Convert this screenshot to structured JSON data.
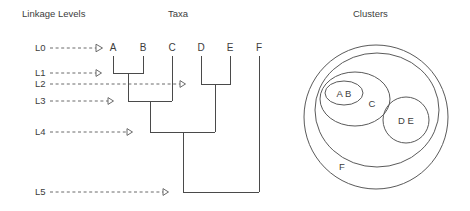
{
  "headings": {
    "linkage": "Linkage Levels",
    "taxa": "Taxa",
    "clusters": "Clusters"
  },
  "levels": [
    {
      "id": "L0",
      "label": "L0",
      "y": 48
    },
    {
      "id": "L1",
      "label": "L1",
      "y": 73
    },
    {
      "id": "L2",
      "label": "L2",
      "y": 84
    },
    {
      "id": "L3",
      "label": "L3",
      "y": 101
    },
    {
      "id": "L4",
      "label": "L4",
      "y": 132
    },
    {
      "id": "L5",
      "label": "L5",
      "y": 192
    }
  ],
  "taxa": [
    {
      "label": "A",
      "x": 113
    },
    {
      "label": "B",
      "x": 143
    },
    {
      "label": "C",
      "x": 172
    },
    {
      "label": "D",
      "x": 201
    },
    {
      "label": "E",
      "x": 230
    },
    {
      "label": "F",
      "x": 259
    }
  ],
  "merges": [
    {
      "name": "A-B",
      "level": "L1"
    },
    {
      "name": "D-E",
      "level": "L2"
    },
    {
      "name": "AB-C",
      "level": "L3"
    },
    {
      "name": "ABC-DE",
      "level": "L4"
    },
    {
      "name": "ABCDE-F",
      "level": "L5"
    }
  ],
  "clusters": {
    "outer_label": "F",
    "groups": [
      {
        "label": "C",
        "members": "A B C"
      },
      {
        "label": "A B",
        "members": "A B"
      },
      {
        "label": "D E",
        "members": "D E"
      }
    ]
  },
  "colors": {
    "line": "#4a4a4a",
    "guide": "#6b6b6b",
    "text": "#3d3d3d",
    "background": "#ffffff"
  }
}
